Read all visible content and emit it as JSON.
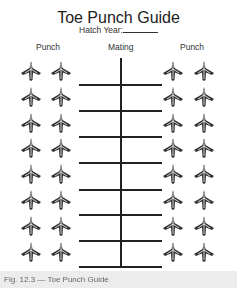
{
  "document": {
    "title": "Toe Punch Guide",
    "hatch_year_label": "Hatch Year:",
    "columns": {
      "left": "Punch",
      "middle": "Mating",
      "right": "Punch"
    },
    "rows": 8,
    "foot_icon": "duck-foot-icon"
  },
  "caption": "Fig. 12.3 — Toe Punch Guide"
}
